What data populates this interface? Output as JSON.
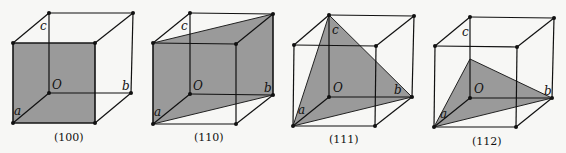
{
  "figure": {
    "axis_labels": {
      "origin": "O",
      "a": "a",
      "b": "b",
      "c": "c"
    },
    "panels": [
      {
        "caption": "(100)",
        "plane": "front face (a-side)"
      },
      {
        "caption": "(110)",
        "plane": "diagonal plane through front-left and back-right edges"
      },
      {
        "caption": "(111)",
        "plane": "triangle through a, b, c"
      },
      {
        "caption": "(112)",
        "plane": "triangle through a, b, half c"
      }
    ],
    "colors": {
      "plane_fill": "#9a9a9a",
      "line": "#111111",
      "background": "#f7f7f5"
    }
  }
}
